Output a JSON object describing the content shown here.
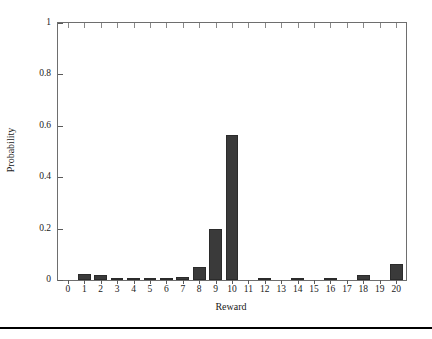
{
  "chart_data": {
    "type": "bar",
    "title": "",
    "subtitle": "",
    "xlabel": "Reward",
    "ylabel": "Probability",
    "categories": [
      "0",
      "1",
      "2",
      "3",
      "4",
      "5",
      "6",
      "7",
      "8",
      "9",
      "10",
      "11",
      "12",
      "13",
      "14",
      "15",
      "16",
      "17",
      "18",
      "19",
      "20"
    ],
    "values": [
      0.0,
      0.025,
      0.02,
      0.005,
      0.002,
      0.004,
      0.002,
      0.012,
      0.05,
      0.197,
      0.565,
      0.0,
      0.003,
      0.0,
      0.004,
      0.0,
      0.008,
      0.0,
      0.021,
      0.0,
      0.062
    ],
    "xlim": [
      -0.6,
      20.6
    ],
    "ylim": [
      0,
      1
    ],
    "ytick_values": [
      0,
      0.2,
      0.4,
      0.6,
      0.8,
      1
    ],
    "ytick_labels": [
      "0",
      "0.2",
      "0.4",
      "0.6",
      "0.8",
      "1"
    ],
    "xtick_labels": [
      "0",
      "1",
      "2",
      "3",
      "4",
      "5",
      "6",
      "7",
      "8",
      "9",
      "10",
      "11",
      "12",
      "13",
      "14",
      "15",
      "16",
      "17",
      "18",
      "19",
      "20"
    ],
    "grid": false,
    "legend": null,
    "legend_position": "none",
    "bar_color": "#3a3a3a",
    "axis_color": "#6e6e6e",
    "background_color": "#ffffff",
    "annotations": []
  },
  "figure": {
    "bottom_rule_color": "#000000"
  }
}
